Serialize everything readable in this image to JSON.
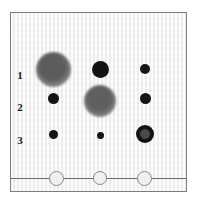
{
  "figure": {
    "kind": "tlc-plate",
    "background_color": "#f2f2f0",
    "frame_color": "#7d7d7d",
    "baseline_color": "#6b6b6b",
    "origin_circle_color": "#8a8a8a"
  },
  "row_labels": [
    {
      "text": "1",
      "x": 14,
      "y": 62
    },
    {
      "text": "2",
      "x": 14,
      "y": 94
    },
    {
      "text": "3",
      "x": 14,
      "y": 127
    }
  ],
  "columns": {
    "x": [
      52,
      99,
      144
    ]
  },
  "spots": [
    {
      "name": "spot-r1-c1",
      "row": "1",
      "column": 1,
      "cx": 52,
      "cy": 68,
      "r": 17.5,
      "color": "#5c5c5c",
      "edge": "diffuse",
      "style": "diffuse-gray"
    },
    {
      "name": "spot-r1-c2",
      "row": "1",
      "column": 2,
      "cx": 99,
      "cy": 68,
      "r": 8.5,
      "color": "#121212",
      "edge": "sharp",
      "style": "solid-dark"
    },
    {
      "name": "spot-r1-c3",
      "row": "1",
      "column": 3,
      "cx": 144,
      "cy": 68,
      "r": 5.0,
      "color": "#161616",
      "edge": "sharp",
      "style": "solid-dark"
    },
    {
      "name": "spot-r2-c1",
      "row": "2",
      "column": 1,
      "cx": 52,
      "cy": 97,
      "r": 5.5,
      "color": "#141414",
      "edge": "sharp",
      "style": "solid-dark"
    },
    {
      "name": "spot-r2-c2",
      "row": "2",
      "column": 2,
      "cx": 99,
      "cy": 100,
      "r": 16.0,
      "color": "#5f5f5f",
      "edge": "diffuse",
      "style": "diffuse-gray"
    },
    {
      "name": "spot-r2-c3",
      "row": "2",
      "column": 3,
      "cx": 144,
      "cy": 97,
      "r": 5.5,
      "color": "#141414",
      "edge": "sharp",
      "style": "solid-dark"
    },
    {
      "name": "spot-r3-c1",
      "row": "3",
      "column": 1,
      "cx": 52,
      "cy": 133,
      "r": 4.5,
      "color": "#151515",
      "edge": "sharp",
      "style": "solid-dark"
    },
    {
      "name": "spot-r3-c2",
      "row": "3",
      "column": 2,
      "cx": 99,
      "cy": 134,
      "r": 3.5,
      "color": "#151515",
      "edge": "sharp",
      "style": "solid-dark"
    },
    {
      "name": "spot-r3-c3",
      "row": "3",
      "column": 3,
      "cx": 144,
      "cy": 133,
      "r": 9.0,
      "color": "#111111",
      "edge": "ring",
      "style": "dark-ring-gray-core",
      "core_color": "#4a4a4a"
    }
  ],
  "baseline": {
    "y": 177,
    "x_start": 0,
    "x_end": 177
  },
  "origin_circles": [
    {
      "name": "origin-circle-1",
      "cx": 55,
      "cy": 177,
      "r": 7.5
    },
    {
      "name": "origin-circle-2",
      "cx": 99,
      "cy": 177,
      "r": 7.0
    },
    {
      "name": "origin-circle-3",
      "cx": 143,
      "cy": 177,
      "r": 7.5
    }
  ]
}
